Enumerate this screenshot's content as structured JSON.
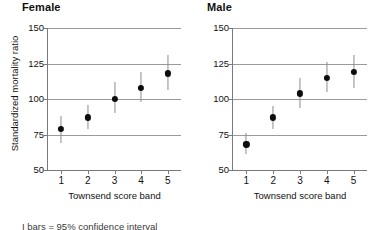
{
  "chart_data": [
    {
      "type": "scatter",
      "title": "Female",
      "xlabel": "Townsend score band",
      "ylabel": "Standardized mortality ratio",
      "categories": [
        "1",
        "2",
        "3",
        "4",
        "5"
      ],
      "values": [
        79,
        87,
        100,
        108,
        118
      ],
      "ci_low": [
        69,
        79,
        90,
        98,
        106
      ],
      "ci_high": [
        88,
        96,
        112,
        119,
        131
      ],
      "yticks": [
        50,
        75,
        100,
        125,
        150
      ],
      "ylim": [
        50,
        150
      ],
      "grid": true,
      "legend": "none"
    },
    {
      "type": "scatter",
      "title": "Male",
      "xlabel": "Townsend score band",
      "ylabel": "Standardized mortality ratio",
      "categories": [
        "1",
        "2",
        "3",
        "4",
        "5"
      ],
      "values": [
        68,
        87,
        104,
        115,
        119
      ],
      "ci_low": [
        61,
        79,
        94,
        105,
        108
      ],
      "ci_high": [
        76,
        95,
        115,
        126,
        131
      ],
      "yticks": [
        50,
        75,
        100,
        125,
        150
      ],
      "ylim": [
        50,
        150
      ],
      "grid": true,
      "legend": "none"
    }
  ],
  "female": {
    "title": "Female",
    "ylabel": "Standardized mortality ratio",
    "xlabel": "Townsend score band",
    "yticks": [
      "150",
      "125",
      "100",
      "75",
      "50"
    ],
    "xticks": [
      "1",
      "2",
      "3",
      "4",
      "5"
    ]
  },
  "male": {
    "title": "Male",
    "ylabel": "Standardized mortality ratio",
    "xlabel": "Townsend score band",
    "yticks": [
      "150",
      "125",
      "100",
      "75",
      "50"
    ],
    "xticks": [
      "1",
      "2",
      "3",
      "4",
      "5"
    ]
  },
  "caption": "I bars = 95% confidence interval",
  "colors": {
    "point": "#0d0d0d",
    "errorbar": "#8c8c8c",
    "grid": "#9a9a9a",
    "axis": "#7a7a7a",
    "text": "#111111"
  }
}
